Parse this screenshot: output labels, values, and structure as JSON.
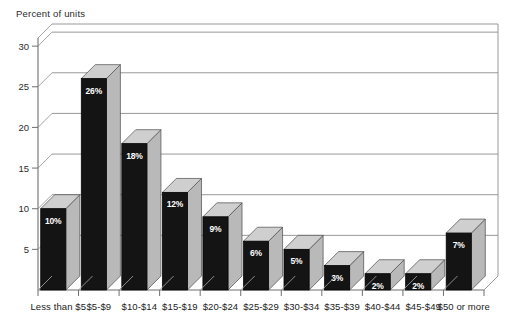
{
  "chart_data": {
    "type": "bar",
    "title": "Percent of units",
    "xlabel": "",
    "ylabel": "Percent of units",
    "ylim": [
      0,
      31
    ],
    "yticks": [
      5,
      10,
      15,
      20,
      25,
      30
    ],
    "ytick_labels": [
      "5",
      "10",
      "15",
      "20",
      "25",
      "30"
    ],
    "grid": true,
    "legend": "none",
    "style": "3d-bar",
    "categories": [
      "Less than $5",
      "$5-$9",
      "$10-$14",
      "$15-$19",
      "$20-$24",
      "$25-$29",
      "$30-$34",
      "$35-$39",
      "$40-$44",
      "$45-$49",
      "$50 or more"
    ],
    "values": [
      10,
      26,
      18,
      12,
      9,
      6,
      5,
      3,
      2,
      2,
      7
    ],
    "data_labels": [
      "10%",
      "26%",
      "18%",
      "12%",
      "9%",
      "6%",
      "5%",
      "3%",
      "2%",
      "2%",
      "7%"
    ],
    "colors": {
      "bar_front": "#141414",
      "bar_side": "#b9b9b9",
      "bar_top": "#cfcfcf",
      "gridline": "#8d8d8d",
      "axis": "#6f6f6f",
      "label_text": "#ffffff",
      "background": "#ffffff"
    }
  }
}
